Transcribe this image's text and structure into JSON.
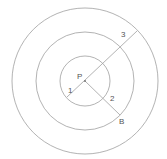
{
  "diagram": {
    "center": {
      "label": "P",
      "x": 85,
      "y": 81
    },
    "circles": [
      {
        "name": "inner",
        "r": 25
      },
      {
        "name": "middle",
        "r": 49
      },
      {
        "name": "outer",
        "r": 73
      }
    ],
    "labels": {
      "p": "P",
      "one": "1",
      "two": "2",
      "three": "3",
      "b": "B"
    },
    "colors": {
      "stroke": "#9a9a9a",
      "text": "#555555",
      "background": "#ffffff"
    }
  }
}
